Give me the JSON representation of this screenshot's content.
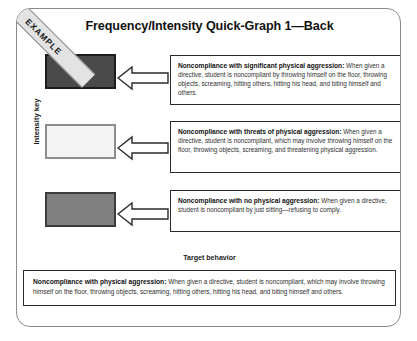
{
  "document": {
    "title": "Frequency/Intensity Quick-Graph 1—Back",
    "banner_label": "EXAMPLE",
    "intensity_key_label": "Intensity key",
    "target_behavior_label": "Target behavior"
  },
  "intensity_levels": [
    {
      "name": "high-intensity-swatch",
      "color": "#4a4a4a",
      "border_color": "#1c1c1c"
    },
    {
      "name": "medium-intensity-swatch",
      "color": "#f4f4f4",
      "border_color": "#8d8d8d"
    },
    {
      "name": "low-intensity-swatch",
      "color": "#808080",
      "border_color": "#3c3c3c"
    }
  ],
  "definitions": [
    {
      "term": "Noncompliance with significant physical aggression:",
      "body": " When given a directive, student is noncompliant by throwing himself on the floor, throwing objects, screaming, hitting others, hitting his head, and biting himself and others."
    },
    {
      "term": "Noncompliance with threats of physical aggression:",
      "body": " When given a directive, student is noncompliant, which may involve throwing himself on the floor, throwing objects, screaming, and threatening physical aggression."
    },
    {
      "term": "Noncompliance with no physical aggression:",
      "body": " When given a directive, student is noncompliant by just sitting—refusing to comply."
    }
  ],
  "target_behavior": {
    "term": "Noncompliance with physical aggression:",
    "body": " When given a directive, student is noncompliant, which may involve throwing himself on the floor, throwing objects, screaming, hitting others, hitting his head, and biting himself and others."
  },
  "arrows": [
    {
      "name": "arrow-to-high-intensity",
      "direction": "left"
    },
    {
      "name": "arrow-to-medium-intensity",
      "direction": "left"
    },
    {
      "name": "arrow-to-low-intensity",
      "direction": "left"
    }
  ]
}
